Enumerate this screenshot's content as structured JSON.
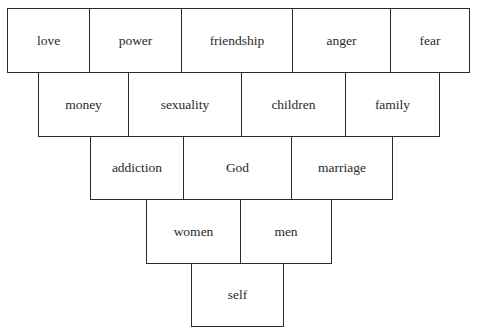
{
  "diagram": {
    "type": "inverted-pyramid-of-boxes",
    "rows": [
      {
        "row": 1,
        "items": [
          "love",
          "power",
          "friendship",
          "anger",
          "fear"
        ]
      },
      {
        "row": 2,
        "items": [
          "money",
          "sexuality",
          "children",
          "family"
        ]
      },
      {
        "row": 3,
        "items": [
          "addiction",
          "God",
          "marriage"
        ]
      },
      {
        "row": 4,
        "items": [
          "women",
          "men"
        ]
      },
      {
        "row": 5,
        "items": [
          "self"
        ]
      }
    ]
  }
}
